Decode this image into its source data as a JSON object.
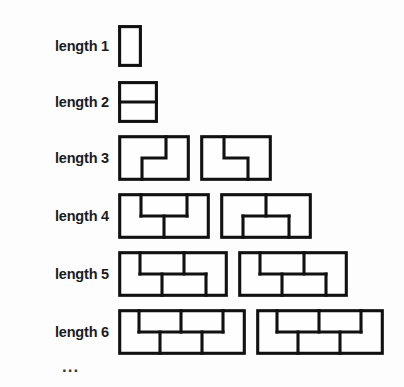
{
  "figure": {
    "ellipsis": "...",
    "brick_unit_px": 24,
    "course_height_px": 19,
    "line_color": "#111111",
    "background_color": "#ffffff",
    "rows": [
      {
        "label": "length 1",
        "length": 1,
        "walls": [
          {
            "name": "wall-1-a",
            "width_units": 1,
            "orientation": "vertical-single-brick",
            "courses": [
              [
                1
              ]
            ],
            "note": "single brick standing on end"
          }
        ]
      },
      {
        "label": "length 2",
        "length": 2,
        "walls": [
          {
            "name": "wall-2-a",
            "width_units": 1,
            "orientation": "two-stacked",
            "courses": [
              [
                1
              ],
              [
                1
              ]
            ],
            "note": "two bricks stacked, square outline split horizontally"
          }
        ]
      },
      {
        "label": "length 3",
        "length": 3,
        "walls": [
          {
            "name": "wall-3-a",
            "width_units": 3,
            "courses": [
              [
                2,
                1
              ],
              [
                1,
                2
              ]
            ],
            "note": "step pattern descending left to right"
          },
          {
            "name": "wall-3-b",
            "width_units": 3,
            "courses": [
              [
                1,
                2
              ],
              [
                2,
                1
              ]
            ],
            "note": "mirrored step pattern"
          }
        ]
      },
      {
        "label": "length 4",
        "length": 4,
        "walls": [
          {
            "name": "wall-4-a",
            "width_units": 4,
            "courses": [
              [
                1,
                2,
                1
              ],
              [
                2,
                2
              ]
            ],
            "note": "top course offset by half brick"
          },
          {
            "name": "wall-4-b",
            "width_units": 4,
            "courses": [
              [
                2,
                2
              ],
              [
                1,
                2,
                1
              ]
            ],
            "note": "bottom course offset by half brick"
          }
        ]
      },
      {
        "label": "length 5",
        "length": 5,
        "walls": [
          {
            "name": "wall-5-a",
            "width_units": 5,
            "courses": [
              [
                1,
                2,
                2
              ],
              [
                2,
                2,
                1
              ]
            ],
            "note": "running bond, five units wide"
          },
          {
            "name": "wall-5-b",
            "width_units": 5,
            "courses": [
              [
                1,
                2,
                2
              ],
              [
                2,
                2,
                1
              ]
            ],
            "note": "running bond variant, five units wide"
          }
        ]
      },
      {
        "label": "length 6",
        "length": 6,
        "walls": [
          {
            "name": "wall-6-a",
            "width_units": 6,
            "courses": [
              [
                1,
                2,
                2,
                1
              ],
              [
                2,
                2,
                2
              ]
            ],
            "note": "six units wide, staggered joints"
          },
          {
            "name": "wall-6-b",
            "width_units": 6,
            "courses": [
              [
                1,
                2,
                2,
                1
              ],
              [
                2,
                2,
                2
              ]
            ],
            "note": "six units wide variant, staggered joints"
          }
        ]
      }
    ]
  }
}
